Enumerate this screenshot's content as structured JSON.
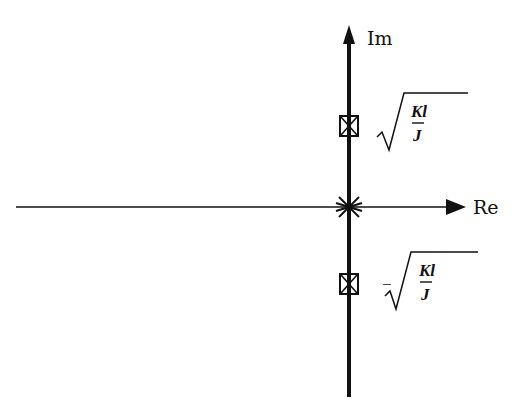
{
  "diagram": {
    "type": "root-locus-pole-zero-plot",
    "axes": {
      "real": {
        "label": "Re",
        "x_start": 16,
        "x_end": 466,
        "y": 207
      },
      "imaginary": {
        "label": "Im",
        "x": 349,
        "y_top": 26,
        "y_bottom": 397
      }
    },
    "colors": {
      "ink": "#111111",
      "background": "#ffffff"
    },
    "markers": [
      {
        "kind": "double-pole",
        "symbol": "star",
        "x": 349,
        "y": 207,
        "name": "origin-double-pole"
      },
      {
        "kind": "pole-zero",
        "symbol": "boxed-x",
        "x": 349,
        "y": 126,
        "name": "upper-pole-zero",
        "label": {
          "sign": "",
          "numerator": "Kl",
          "denominator": "J",
          "text": "√(Kl/J)"
        }
      },
      {
        "kind": "pole-zero",
        "symbol": "boxed-x",
        "x": 349,
        "y": 284,
        "name": "lower-pole-zero",
        "label": {
          "sign": "−",
          "numerator": "Kl",
          "denominator": "J",
          "text": "−√(Kl/J)"
        }
      }
    ]
  }
}
